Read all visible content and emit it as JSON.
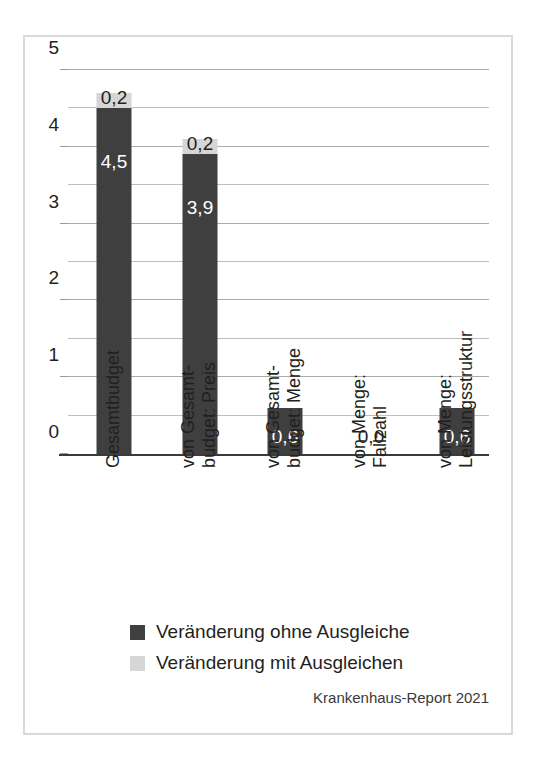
{
  "chart_data": {
    "type": "bar",
    "stacked": true,
    "title": "",
    "subtitle": "",
    "xlabel": "",
    "ylabel": "",
    "ylim": [
      0,
      5
    ],
    "yticks": [
      0,
      1,
      2,
      3,
      4,
      5
    ],
    "ytick_labels": [
      "0",
      "1",
      "2",
      "3",
      "4",
      "5"
    ],
    "grid": true,
    "gridline_interval": 0.5,
    "gridlines": [
      0.5,
      1,
      1.5,
      2,
      2.5,
      3,
      3.5,
      4,
      4.5,
      5
    ],
    "legend_position": "bottom-left",
    "categories": [
      "Gesamtbudget",
      "von Gesamtbudget: Preis",
      "von Gesamtbudget: Menge",
      "von Menge: Fallzahl",
      "von Menge: Leistungsstruktur"
    ],
    "category_lines": [
      [
        "Gesamtbudget",
        ""
      ],
      [
        "von Gesamt-",
        "budget: Preis"
      ],
      [
        "von Gesamt-",
        "budget: Menge"
      ],
      [
        "von Menge:",
        "Fallzahl"
      ],
      [
        "von Menge:",
        "Leistungsstruktur"
      ]
    ],
    "series": [
      {
        "name": "Veränderung ohne Ausgleiche",
        "color": "#3f3f3f",
        "values": [
          4.5,
          3.9,
          0.6,
          0.0,
          0.6
        ],
        "value_labels": [
          "4,5",
          "3,9",
          "0,6",
          "0,0",
          "0,6"
        ]
      },
      {
        "name": "Veränderung mit Ausgleichen",
        "color": "#d6d6d6",
        "values": [
          0.2,
          0.2,
          0.0,
          0.0,
          0.0
        ],
        "value_labels": [
          "0,2",
          "0,2",
          "",
          "",
          ""
        ]
      }
    ],
    "source": "Krankenhaus-Report 2021"
  },
  "legend": {
    "items": [
      {
        "label": "Veränderung ohne Ausgleiche",
        "color": "#3f3f3f"
      },
      {
        "label": "Veränderung mit Ausgleichen",
        "color": "#d6d6d6"
      }
    ]
  },
  "source_note": "Krankenhaus-Report 2021",
  "axis": {
    "y_tick_labels": [
      "5",
      "4",
      "3",
      "2",
      "1",
      "0"
    ]
  },
  "colors": {
    "bar_dark": "#3f3f3f",
    "bar_light": "#d6d6d6",
    "gridline": "#bfbfbf",
    "axis": "#3a3a3a",
    "frame": "#d9d9d9",
    "text": "#231f20",
    "text_on_dark": "#ffffff"
  }
}
